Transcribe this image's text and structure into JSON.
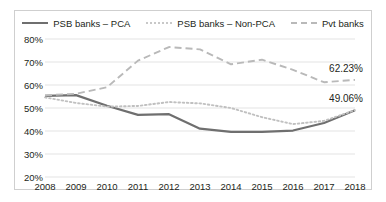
{
  "chart_data": {
    "type": "line",
    "title": "",
    "xlabel": "",
    "ylabel": "",
    "categories": [
      "2008",
      "2009",
      "2010",
      "2011",
      "2012",
      "2013",
      "2014",
      "2015",
      "2016",
      "2017",
      "2018"
    ],
    "ylim": [
      20,
      80
    ],
    "ytick_labels": [
      "20%",
      "30%",
      "40%",
      "50%",
      "60%",
      "70%",
      "80%"
    ],
    "ytick_values": [
      20,
      30,
      40,
      50,
      60,
      70,
      80
    ],
    "grid": true,
    "legend_position": "top-center",
    "series": [
      {
        "name": "PSB banks – PCA",
        "style": "solid",
        "color": "#6f6f6f",
        "values": [
          55.3,
          55.6,
          51.0,
          47.0,
          47.3,
          41.0,
          39.6,
          39.6,
          40.2,
          43.5,
          49.06
        ]
      },
      {
        "name": "PSB banks – Non-PCA",
        "style": "dotted",
        "color": "#c0c0c0",
        "values": [
          54.6,
          52.2,
          50.6,
          50.9,
          52.6,
          52.0,
          50.0,
          46.0,
          43.0,
          44.4,
          49.06
        ]
      },
      {
        "name": "Pvt banks",
        "style": "dashed",
        "color": "#b9b9b9",
        "values": [
          55.5,
          56.2,
          59.0,
          70.6,
          76.5,
          75.5,
          69.0,
          71.0,
          66.6,
          61.2,
          62.23
        ]
      }
    ],
    "annotations": [
      {
        "text": "62.23%",
        "series": "Pvt banks",
        "category": "2018",
        "value": 62.23
      },
      {
        "text": "49.06%",
        "series": "PSB banks – PCA",
        "category": "2018",
        "value": 49.06
      }
    ]
  },
  "legend": {
    "items": [
      {
        "label": "PSB banks – PCA",
        "style": "solid"
      },
      {
        "label": "PSB banks – Non-PCA",
        "style": "dotted"
      },
      {
        "label": "Pvt banks",
        "style": "dashed"
      }
    ]
  },
  "colors": {
    "pca_line": "#6f6f6f",
    "nonpca_line": "#c0c0c0",
    "pvt_line": "#b9b9b9",
    "gridline": "#e3e3e3",
    "border": "#cfcfcf",
    "text": "#231f20"
  }
}
